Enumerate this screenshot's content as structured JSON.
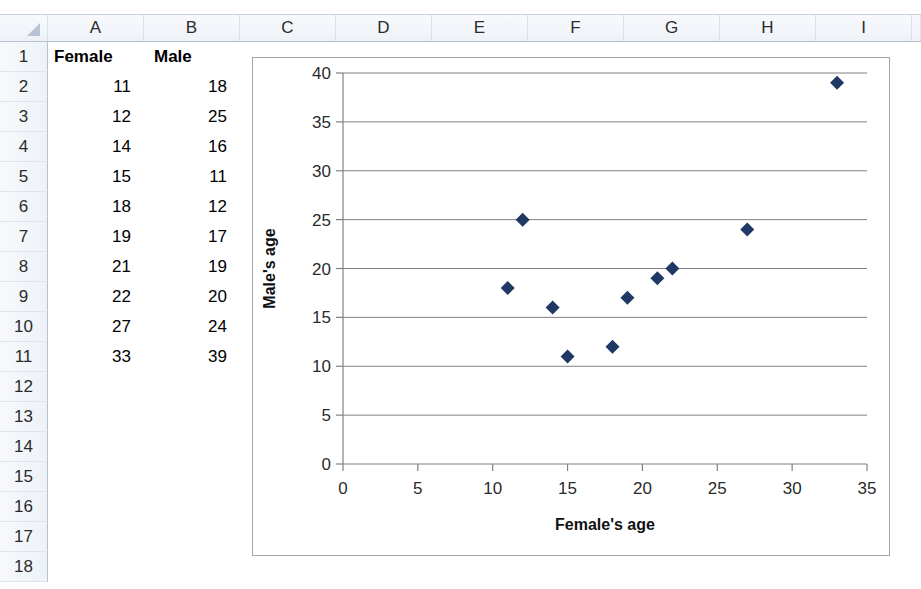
{
  "spreadsheet": {
    "columns": [
      "A",
      "B",
      "C",
      "D",
      "E",
      "F",
      "G",
      "H",
      "I"
    ],
    "rows": [
      "1",
      "2",
      "3",
      "4",
      "5",
      "6",
      "7",
      "8",
      "9",
      "10",
      "11",
      "12",
      "13",
      "14",
      "15",
      "16",
      "17",
      "18"
    ],
    "header_row": {
      "a": "Female",
      "b": "Male"
    },
    "data_rows": [
      {
        "a": "11",
        "b": "18"
      },
      {
        "a": "12",
        "b": "25"
      },
      {
        "a": "14",
        "b": "16"
      },
      {
        "a": "15",
        "b": "11"
      },
      {
        "a": "18",
        "b": "12"
      },
      {
        "a": "19",
        "b": "17"
      },
      {
        "a": "21",
        "b": "19"
      },
      {
        "a": "22",
        "b": "20"
      },
      {
        "a": "27",
        "b": "24"
      },
      {
        "a": "33",
        "b": "39"
      }
    ]
  },
  "chart_data": {
    "type": "scatter",
    "title": "",
    "xlabel": "Female's age",
    "ylabel": "Male's age",
    "xlim": [
      0,
      35
    ],
    "ylim": [
      0,
      40
    ],
    "xticks": [
      0,
      5,
      10,
      15,
      20,
      25,
      30,
      35
    ],
    "yticks": [
      0,
      5,
      10,
      15,
      20,
      25,
      30,
      35,
      40
    ],
    "grid": "horizontal",
    "legend": "none",
    "marker": "diamond",
    "marker_color": "#1F3864",
    "series": [
      {
        "name": "Ages",
        "points": [
          {
            "x": 11,
            "y": 18
          },
          {
            "x": 12,
            "y": 25
          },
          {
            "x": 14,
            "y": 16
          },
          {
            "x": 15,
            "y": 11
          },
          {
            "x": 18,
            "y": 12
          },
          {
            "x": 19,
            "y": 17
          },
          {
            "x": 21,
            "y": 19
          },
          {
            "x": 22,
            "y": 20
          },
          {
            "x": 27,
            "y": 24
          },
          {
            "x": 33,
            "y": 39
          }
        ]
      }
    ]
  }
}
